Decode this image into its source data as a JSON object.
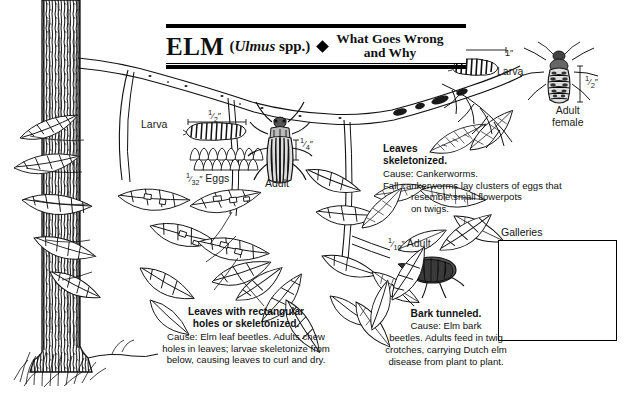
{
  "header": {
    "title": "ELM",
    "scientific_prefix": "(",
    "scientific_italic": "Ulmus",
    "scientific_suffix": " spp.)",
    "bullet": "diamond",
    "subtitle_line1": "What Goes Wrong",
    "subtitle_line2": "and Why"
  },
  "labels": {
    "larva_left": "Larva",
    "larva_left_size": "1/2\"",
    "eggs": "Eggs",
    "eggs_size": "1/32\"",
    "beetle_adult": "Adult",
    "beetle_adult_size": "1/4\"",
    "cankerworm_larva": "Larva",
    "cankerworm_larva_size": "1\"",
    "cankerworm_adult_line1": "Adult",
    "cankerworm_adult_line2": "female",
    "cankerworm_adult_size": "1/2\"",
    "bark_beetle_adult": "Adult",
    "bark_beetle_adult_size": "1/10\"",
    "galleries": "Galleries"
  },
  "captions": {
    "leaf_beetle": {
      "heading_line1": "Leaves with rectangular",
      "heading_line2": "holes or skeletonized.",
      "body_line1": "Cause: Elm leaf beetles. Adults chew",
      "body_line2": "holes in leaves; larvae skeletonize from",
      "body_line3": "below, causing leaves to curl and dry."
    },
    "cankerworm": {
      "heading_line1": "Leaves",
      "heading_line2": "skeletonized.",
      "body_line1": "Cause: Cankerworms.",
      "body_line2": "Fall cankerworms lay clusters of eggs that",
      "body_line3": "resemble small flowerpots",
      "body_line4": "on twigs."
    },
    "bark_beetle": {
      "heading": "Bark tunneled.",
      "body_line1": "Cause: Elm bark",
      "body_line2": "beetles. Adults feed in twig",
      "body_line3": "crotches, carrying Dutch elm",
      "body_line4": "disease from plant to plant."
    }
  },
  "colors": {
    "ink": "#111111",
    "background": "#ffffff",
    "page_surround": "#d8d8d8"
  }
}
